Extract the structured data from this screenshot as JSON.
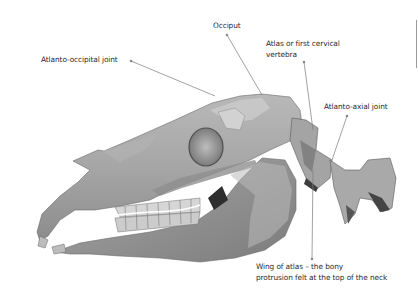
{
  "diagram": {
    "labels": [
      {
        "id": "atlanto-occipital-joint",
        "text": "Atlanto-occipital joint"
      },
      {
        "id": "occiput",
        "text": "Occiput"
      },
      {
        "id": "atlas",
        "line1": "Atlas or first cervical",
        "line2": "vertebra"
      },
      {
        "id": "atlanto-axial-joint",
        "text": "Atlanto-axial joint"
      },
      {
        "id": "wing-of-atlas",
        "line1": "Wing of atlas – the bony",
        "line2": "protrusion felt at the top of the neck"
      }
    ],
    "colors": {
      "background": "#ffffff",
      "bone_light": "#c4c4c4",
      "bone_mid": "#9e9e9e",
      "bone_dark": "#5e5e5e",
      "leader_line": "#7a7a7a",
      "text": "#2a2a2a"
    }
  }
}
